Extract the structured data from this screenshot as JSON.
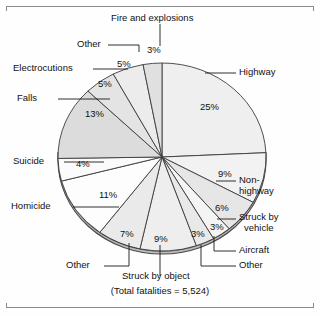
{
  "figure": {
    "caption": "(Total fatalities  =  5,524)"
  },
  "chart_data": {
    "type": "pie",
    "title": "",
    "xlabel": "",
    "ylabel": "",
    "total_label": "(Total fatalities  =  5,524)",
    "total_value": 5524,
    "units": "percent",
    "start_angle_deg": 0,
    "direction": "clockwise",
    "legend": "none",
    "grid": false,
    "three_d": true,
    "labels": [
      "Highway",
      "Non-highway",
      "Struck by vehicle",
      "Aircraft",
      "Other",
      "Struck by object",
      "Other",
      "Homicide",
      "Suicide",
      "Falls",
      "Electrocutions",
      "Other",
      "Fire and explosions"
    ],
    "values": [
      25,
      9,
      6,
      3,
      3,
      9,
      7,
      11,
      4,
      13,
      5,
      5,
      3
    ],
    "value_labels": [
      "25%",
      "9%",
      "6%",
      "3%",
      "3%",
      "9%",
      "7%",
      "11%",
      "4%",
      "13%",
      "5%",
      "5%",
      "3%"
    ],
    "colors": [
      "#efefef",
      "#f2f2f2",
      "#e6e6e6",
      "#f4f4f4",
      "#e9e9e9",
      "#eeeeee",
      "#eaeaea",
      "#fdfdfd",
      "#fbfbfb",
      "#dcdcdc",
      "#e4e4e4",
      "#ececec",
      "#e0e0e0"
    ],
    "slices": [
      {
        "label": "Highway",
        "value": 25,
        "display": "25%"
      },
      {
        "label": "Non-highway",
        "value": 9,
        "display": "9%"
      },
      {
        "label": "Struck by vehicle",
        "value": 6,
        "display": "6%"
      },
      {
        "label": "Aircraft",
        "value": 3,
        "display": "3%"
      },
      {
        "label": "Other",
        "value": 3,
        "display": "3%"
      },
      {
        "label": "Struck by object",
        "value": 9,
        "display": "9%"
      },
      {
        "label": "Other",
        "value": 7,
        "display": "7%"
      },
      {
        "label": "Homicide",
        "value": 11,
        "display": "11%"
      },
      {
        "label": "Suicide",
        "value": 4,
        "display": "4%"
      },
      {
        "label": "Falls",
        "value": 13,
        "display": "13%"
      },
      {
        "label": "Electrocutions",
        "value": 5,
        "display": "5%"
      },
      {
        "label": "Other",
        "value": 5,
        "display": "5%"
      },
      {
        "label": "Fire and explosions",
        "value": 3,
        "display": "3%"
      }
    ]
  },
  "callouts": {
    "fire_and_explosions": "Fire and explosions",
    "other_top": "Other",
    "electrocutions": "Electrocutions",
    "falls": "Falls",
    "suicide": "Suicide",
    "homicide": "Homicide",
    "other_bottom_left": "Other",
    "struck_by_object": "Struck by object",
    "other_bottom_right": "Other",
    "aircraft": "Aircraft",
    "struck_by_vehicle_l1": "Struck by",
    "struck_by_vehicle_l2": "vehicle",
    "non_highway_l1": "Non-",
    "non_highway_l2": "highway",
    "highway": "Highway"
  },
  "percents": {
    "highway": "25%",
    "non_highway": "9%",
    "struck_by_vehicle": "6%",
    "aircraft": "3%",
    "other_right": "3%",
    "struck_by_object": "9%",
    "other_bottom": "7%",
    "homicide": "11%",
    "suicide": "4%",
    "falls": "13%",
    "electrocutions": "5%",
    "other_top": "5%",
    "fire": "3%"
  }
}
